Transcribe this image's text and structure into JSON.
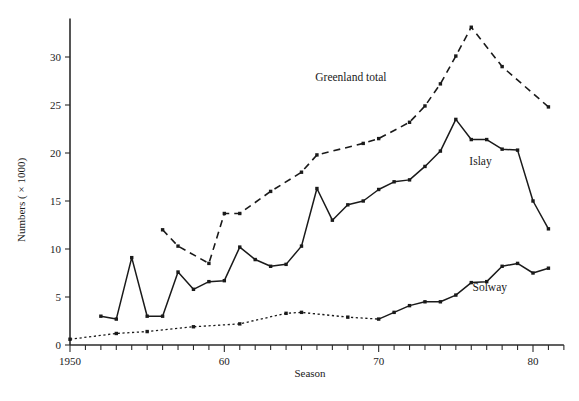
{
  "chart_data": {
    "type": "line",
    "title": "",
    "xlabel": "Season",
    "ylabel": "Numbers ( × 1000)",
    "xlim": [
      1950,
      1982
    ],
    "ylim": [
      0,
      34
    ],
    "grid": false,
    "legend_position": "inline-labels",
    "x_tick_labels": [
      "1950",
      "60",
      "70",
      "80"
    ],
    "x_tick_values": [
      1950,
      1960,
      1970,
      1980
    ],
    "x_minor_ticks_every": 1,
    "y_tick_labels": [
      "0",
      "5",
      "10",
      "15",
      "20",
      "25",
      "30"
    ],
    "y_tick_values": [
      0,
      5,
      10,
      15,
      20,
      25,
      30
    ],
    "series": [
      {
        "name": "Greenland total",
        "style": "dashed",
        "label_x": 1968.2,
        "label_y": 27.5,
        "x": [
          1956,
          1957,
          1959,
          1960,
          1961,
          1963,
          1965,
          1966,
          1969,
          1970,
          1972,
          1973,
          1974,
          1975,
          1976,
          1978,
          1981
        ],
        "y": [
          12.0,
          10.3,
          8.5,
          13.7,
          13.7,
          16.0,
          18.0,
          19.8,
          21.0,
          21.5,
          23.2,
          24.9,
          27.2,
          30.1,
          33.1,
          29.0,
          24.8
        ]
      },
      {
        "name": "Islay",
        "style": "solid",
        "label_x": 1976.6,
        "label_y": 18.7,
        "x": [
          1952,
          1953,
          1954,
          1955,
          1956,
          1957,
          1958,
          1959,
          1960,
          1961,
          1962,
          1963,
          1964,
          1965,
          1966,
          1967,
          1968,
          1969,
          1970,
          1971,
          1972,
          1973,
          1974,
          1975,
          1976,
          1977,
          1978,
          1979,
          1980,
          1981
        ],
        "y": [
          3.0,
          2.7,
          9.1,
          3.0,
          3.0,
          7.6,
          5.8,
          6.6,
          6.7,
          10.2,
          8.9,
          8.2,
          8.4,
          10.3,
          16.3,
          13.0,
          14.6,
          15.0,
          16.2,
          17.0,
          17.2,
          18.6,
          20.2,
          23.5,
          21.4,
          21.4,
          20.4,
          20.3,
          15.0,
          12.1
        ]
      },
      {
        "name": "Solway",
        "style": "dotted-then-solid",
        "solid_from": 1970,
        "label_x": 1977.2,
        "label_y": 5.6,
        "x": [
          1950,
          1953,
          1955,
          1958,
          1961,
          1964,
          1965,
          1968,
          1970,
          1971,
          1972,
          1973,
          1974,
          1975,
          1976,
          1977,
          1978,
          1979,
          1980,
          1981
        ],
        "y": [
          0.6,
          1.2,
          1.4,
          1.9,
          2.2,
          3.3,
          3.4,
          2.9,
          2.7,
          3.4,
          4.1,
          4.5,
          4.5,
          5.2,
          6.5,
          6.6,
          8.2,
          8.5,
          7.5,
          8.0
        ]
      }
    ]
  }
}
